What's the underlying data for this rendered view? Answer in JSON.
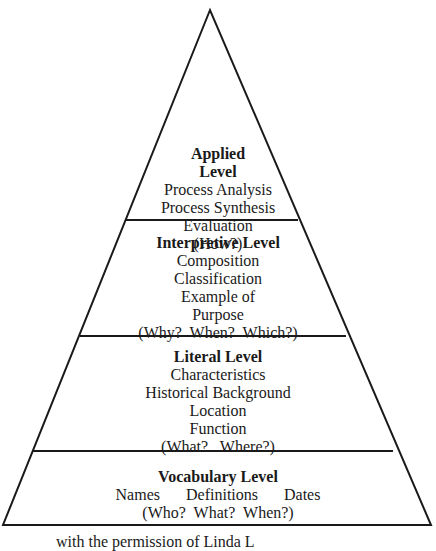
{
  "diagram": {
    "type": "pyramid",
    "levels": [
      {
        "title": "Applied Level",
        "title_lines": [
          "Applied",
          "Level"
        ],
        "items": [
          "Process Analysis",
          "Process Synthesis",
          "Evaluation",
          "(How?)"
        ]
      },
      {
        "title": "Interpretive Level",
        "items": [
          "Composition",
          "Classification",
          "Example of",
          "Purpose",
          "(Why?  When?  Which?)"
        ]
      },
      {
        "title": "Literal Level",
        "items": [
          "Characteristics",
          "Historical Background",
          "Location",
          "Function",
          "(What?   Where?)"
        ]
      },
      {
        "title": "Vocabulary Level",
        "items_row": [
          "Names",
          "Definitions",
          "Dates"
        ],
        "items": [
          "(Who?  What?  When?)"
        ]
      }
    ],
    "caption": "with the permission of Linda L"
  },
  "colors": {
    "line": "#1a1a1a",
    "background": "#ffffff"
  }
}
